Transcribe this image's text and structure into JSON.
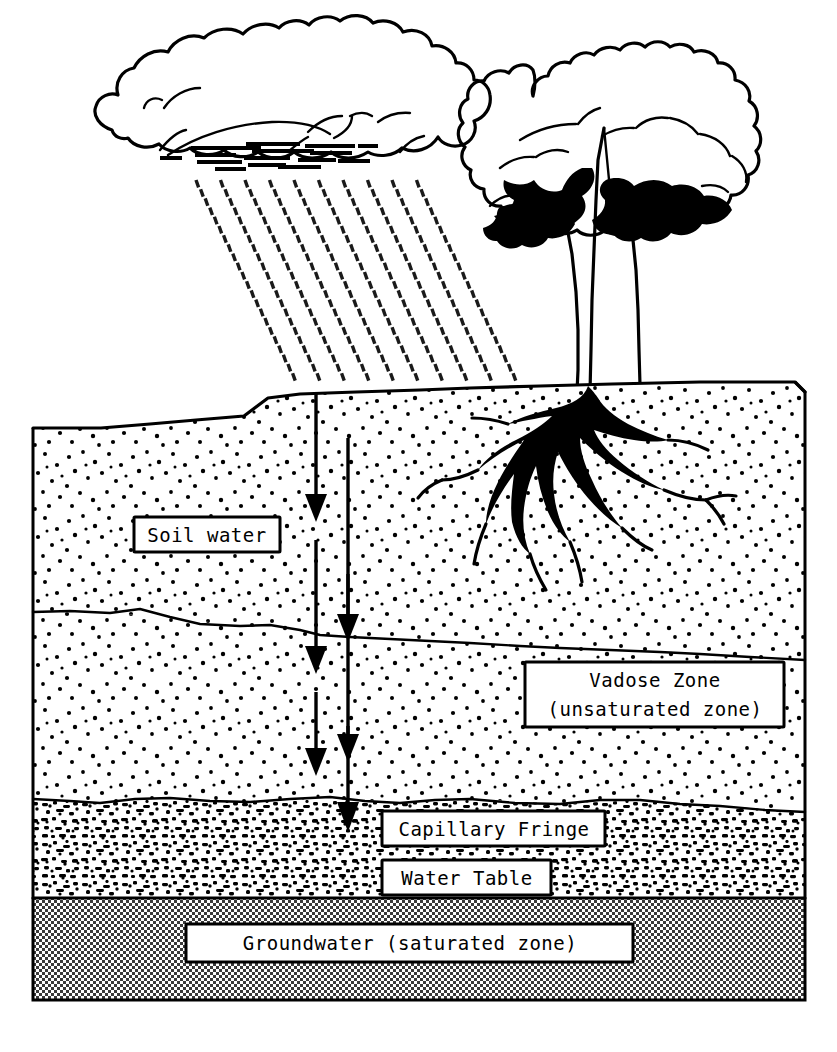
{
  "diagram": {
    "background_color": "#ffffff",
    "ink_color": "#000000",
    "groundwater_fill": "#b5b5b5"
  },
  "labels": {
    "soil_water": "Soil water",
    "vadose_zone_line1": "Vadose Zone",
    "vadose_zone_line2": "(unsaturated zone)",
    "capillary_fringe": "Capillary Fringe",
    "water_table": "Water Table",
    "groundwater": "Groundwater (saturated zone)"
  },
  "scene": {
    "cloud": "rain-cloud",
    "rain": "rainfall-dashes",
    "tree": "deciduous-tree",
    "roots": "tree-root-system",
    "infiltration_arrows": "downward-infiltration-arrows"
  },
  "zones": [
    {
      "id": "soil-water-zone",
      "label": "Soil water",
      "texture": "sparse-stipple"
    },
    {
      "id": "vadose-zone",
      "label": "Vadose Zone (unsaturated zone)",
      "texture": "sparse-stipple"
    },
    {
      "id": "capillary-fringe-zone",
      "label": "Capillary Fringe",
      "texture": "dense-speckle"
    },
    {
      "id": "groundwater-zone",
      "label": "Groundwater (saturated zone)",
      "texture": "halftone-gray"
    }
  ]
}
